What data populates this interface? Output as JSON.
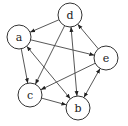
{
  "graph": {
    "type": "directed",
    "nodes": [
      {
        "id": "d",
        "label": "d",
        "x": 70,
        "y": 15
      },
      {
        "id": "a",
        "label": "a",
        "x": 19,
        "y": 37
      },
      {
        "id": "e",
        "label": "e",
        "x": 106,
        "y": 58
      },
      {
        "id": "c",
        "label": "c",
        "x": 30,
        "y": 95
      },
      {
        "id": "b",
        "label": "b",
        "x": 78,
        "y": 108
      }
    ],
    "node_radius": 12,
    "edges": [
      {
        "from": "d",
        "to": "a",
        "bidirectional": false
      },
      {
        "from": "a",
        "to": "e",
        "bidirectional": false
      },
      {
        "from": "a",
        "to": "c",
        "bidirectional": false
      },
      {
        "from": "a",
        "to": "b",
        "bidirectional": true
      },
      {
        "from": "d",
        "to": "c",
        "bidirectional": false
      },
      {
        "from": "d",
        "to": "b",
        "bidirectional": true
      },
      {
        "from": "e",
        "to": "d",
        "bidirectional": false
      },
      {
        "from": "e",
        "to": "c",
        "bidirectional": false
      },
      {
        "from": "e",
        "to": "b",
        "bidirectional": true
      },
      {
        "from": "c",
        "to": "b",
        "bidirectional": false
      }
    ],
    "colors": {
      "stroke": "#333333",
      "fill": "#ffffff",
      "text": "#222222"
    }
  }
}
